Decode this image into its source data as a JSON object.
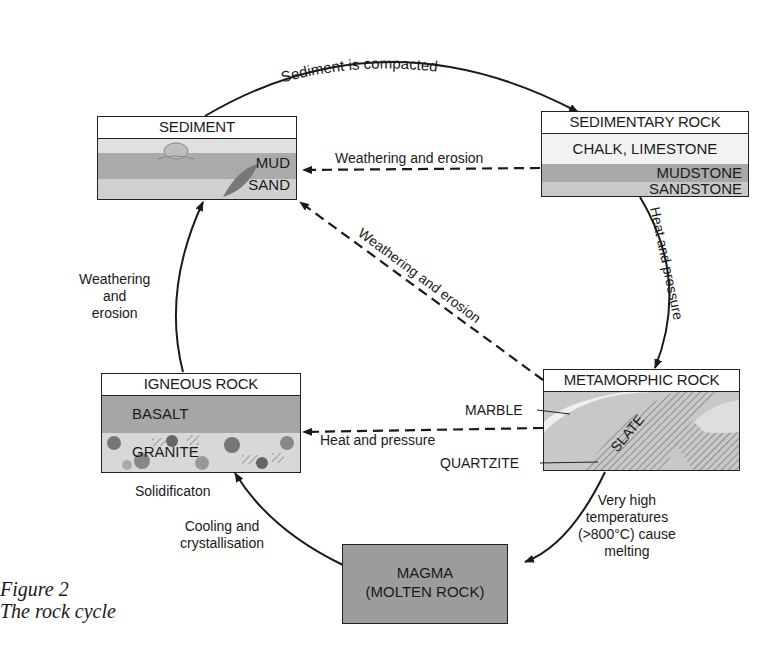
{
  "figure": {
    "number": "Figure 2",
    "title": "The rock cycle"
  },
  "nodes": {
    "sediment": {
      "title": "SEDIMENT",
      "layers": [
        "MUD",
        "SAND"
      ]
    },
    "sedimentary_rock": {
      "title": "SEDIMENTARY ROCK",
      "layers": [
        "CHALK, LIMESTONE",
        "MUDSTONE",
        "SANDSTONE"
      ]
    },
    "metamorphic_rock": {
      "title": "METAMORPHIC ROCK",
      "layers": [
        "MARBLE",
        "SLATE",
        "QUARTZITE"
      ]
    },
    "igneous_rock": {
      "title": "IGNEOUS ROCK",
      "layers": [
        "BASALT",
        "GRANITE"
      ]
    },
    "magma": {
      "line1": "MAGMA",
      "line2": "(MOLTEN ROCK)"
    }
  },
  "arrows": {
    "compaction": "Sediment is compacted",
    "sed_to_sediment": "Weathering and erosion",
    "sed_to_meta": "Heat and pressure",
    "meta_to_sediment": "Weathering and erosion",
    "meta_to_magma": [
      "Very high",
      "temperatures",
      "(>800°C) cause",
      "melting"
    ],
    "magma_to_igneous": [
      "Cooling and",
      "crystallisation"
    ],
    "igneous_solidification": "Solidificaton",
    "igneous_to_sediment": [
      "Weathering",
      "and",
      "erosion"
    ],
    "igneous_to_meta": "Heat and pressure"
  },
  "colors": {
    "ink": "#1a1a1a",
    "mud": "#a9a9a9",
    "sand": "#cfcfcf",
    "light": "#e2e2e2",
    "magma": "#9c9c9c",
    "basalt": "#a6a6a6"
  }
}
